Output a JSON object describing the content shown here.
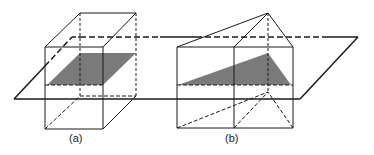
{
  "figure": {
    "labels": {
      "a": "(a)",
      "b": "(b)"
    },
    "colors": {
      "line": "#1a1a1a",
      "shade": "#7a7a7a",
      "background": "#ffffff"
    }
  }
}
